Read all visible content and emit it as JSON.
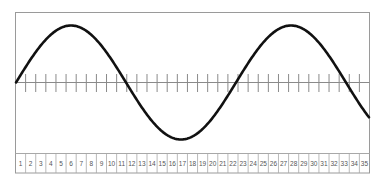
{
  "diagram": {
    "type": "sine-wave-grid",
    "frame": {
      "x": 15.5,
      "y": 12.5,
      "width": 354,
      "height": 160.5
    },
    "axis": {
      "y": 82.5,
      "x_start": 15.5,
      "x_end": 369.5
    },
    "ticks": {
      "count": 34,
      "spacing": 10.114,
      "y_top": 74,
      "y_bottom": 92
    },
    "wave": {
      "x_start": 16,
      "x_end": 369,
      "period_px": 220,
      "amplitude_px": 57,
      "phase_start": "zero-crossing-rising",
      "stroke": "#111111",
      "stroke_width": 2.6
    },
    "number_strip": {
      "y_top": 153.5,
      "y_bottom": 173,
      "cells": [
        "1",
        "2",
        "3",
        "4",
        "5",
        "6",
        "7",
        "8",
        "9",
        "10",
        "11",
        "12",
        "13",
        "14",
        "15",
        "16",
        "17",
        "18",
        "19",
        "20",
        "21",
        "22",
        "23",
        "24",
        "25",
        "26",
        "27",
        "28",
        "29",
        "30",
        "31",
        "32",
        "33",
        "34",
        "35"
      ]
    },
    "colors": {
      "frame": "#9a9a9a",
      "axis": "#8a8a8a",
      "tick": "#8a8a8a",
      "cell_border": "#a8a8a8",
      "number": "#555555",
      "wave": "#111111",
      "background": "#ffffff"
    }
  }
}
